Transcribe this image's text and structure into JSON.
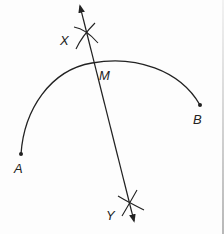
{
  "figure": {
    "colors": {
      "ink": "#222222",
      "background": "#fdfdfd"
    },
    "points": {
      "A": {
        "label": "A",
        "x": 21,
        "y": 154
      },
      "B": {
        "label": "B",
        "x": 200,
        "y": 105
      },
      "M": {
        "label": "M",
        "x": 93,
        "y": 63
      },
      "X": {
        "label": "X",
        "x": 86,
        "y": 32
      },
      "Y": {
        "label": "Y",
        "x": 129,
        "y": 204
      }
    },
    "labels": {
      "A": "A",
      "B": "B",
      "M": "M",
      "X": "X",
      "Y": "Y"
    },
    "elements": [
      {
        "type": "arc",
        "name": "arc-AB",
        "from": "A",
        "to": "B"
      },
      {
        "type": "line-with-arrows",
        "name": "bisector-XY",
        "through": [
          "X",
          "Y"
        ]
      },
      {
        "type": "compass-arc-cross",
        "name": "cross-at-X",
        "at": "X"
      },
      {
        "type": "compass-arc-cross",
        "name": "cross-at-Y",
        "at": "Y"
      }
    ]
  }
}
